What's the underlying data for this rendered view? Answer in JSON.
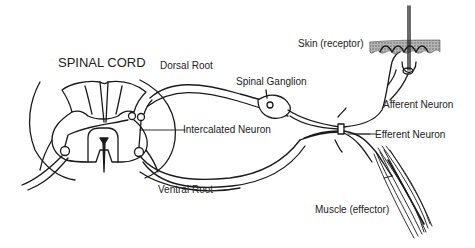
{
  "diagram": {
    "title": "SPINAL CORD",
    "labels": {
      "dorsal_root": "Dorsal Root",
      "spinal_ganglion": "Spinal Ganglion",
      "intercalated_neuron": "Intercalated Neuron",
      "ventral_root": "Ventral Root",
      "skin": "Skin (receptor)",
      "afferent_neuron": "Afferent Neuron",
      "efferent_neuron": "Efferent Neuron",
      "muscle": "Muscle (effector)"
    },
    "colors": {
      "line": "#1a1a1a",
      "skin_fill": "#9a9a9a",
      "background": "#ffffff"
    }
  }
}
